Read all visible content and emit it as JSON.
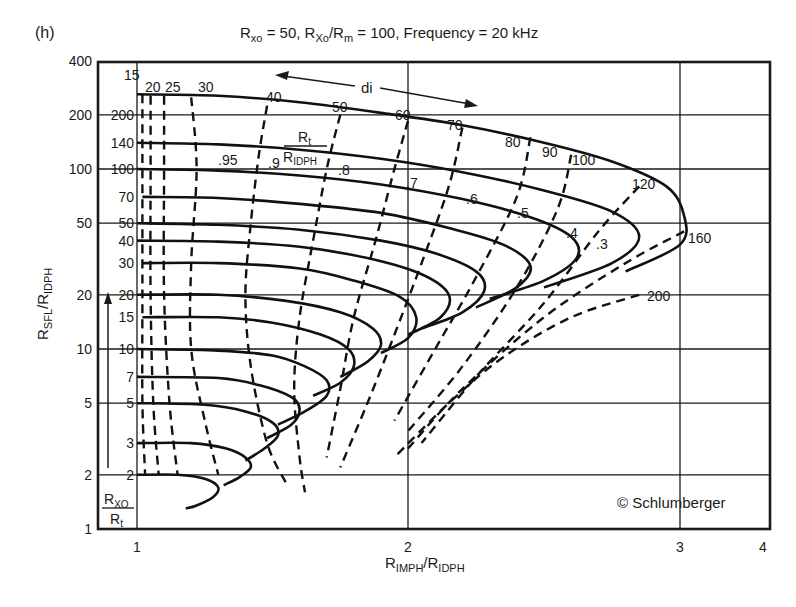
{
  "chart_data": {
    "type": "line",
    "panel_label": "(h)",
    "title": "Rxo = 50, Rxo/Rm = 100, Frequency = 20 kHz",
    "title_parts": {
      "r1": "R",
      "s1": "xo",
      "eq1": " = 50, ",
      "r2": "R",
      "s2": "Xo",
      "slash": "/R",
      "s3": "m",
      "eq2": " = 100, Frequency = 20 kHz"
    },
    "xlabel": "RIMPH/RIDPH",
    "xlabel_parts": {
      "r1": "R",
      "s1": "IMPH",
      "slash": "/R",
      "s2": "IDPH"
    },
    "ylabel": "RSFL/RIDPH",
    "ylabel_parts": {
      "r1": "R",
      "s1": "SFL",
      "slash": "/R",
      "s2": "IDPH"
    },
    "x_scale": "log-like (custom)",
    "y_scale": "log",
    "xlim": [
      1,
      4
    ],
    "ylim": [
      1,
      400
    ],
    "x_ticks": [
      "1",
      "2",
      "3",
      "4"
    ],
    "y_ticks": [
      "1",
      "2",
      "5",
      "10",
      "20",
      "50",
      "100",
      "200",
      "400"
    ],
    "grid": true,
    "rxo_rt_ticks": [
      "2",
      "3",
      "5",
      "7",
      "10",
      "15",
      "20",
      "30",
      "40",
      "50",
      "70",
      "100",
      "140",
      "200"
    ],
    "rxo_rt_label": {
      "num_r": "R",
      "num_s": "XO",
      "den_r": "R",
      "den_s": "t"
    },
    "rt_label": {
      "num_r": "R",
      "num_s": "t",
      "den_r": "R",
      "den_s": "IDPH"
    },
    "di_label": "di",
    "di_values": [
      "15",
      "20",
      "25",
      "30",
      "40",
      "50",
      "60",
      "70",
      "80",
      "90",
      "100",
      "120",
      "160",
      "200"
    ],
    "rt_ratio_values": [
      ".95",
      ".9",
      ".8",
      ".7",
      ".6",
      ".5",
      ".4",
      ".3"
    ],
    "copyright": "© Schlumberger",
    "series": [
      {
        "name": "Rxo/Rt = 200",
        "style": "solid",
        "points": [
          [
            1.0,
            260
          ],
          [
            1.3,
            255
          ],
          [
            1.6,
            235
          ],
          [
            1.9,
            205
          ],
          [
            2.2,
            175
          ],
          [
            2.5,
            140
          ],
          [
            2.75,
            110
          ],
          [
            2.95,
            80
          ],
          [
            3.05,
            55
          ],
          [
            3.0,
            38
          ],
          [
            2.8,
            27
          ]
        ]
      },
      {
        "name": "Rxo/Rt = 140",
        "style": "solid",
        "points": [
          [
            1.0,
            140
          ],
          [
            1.3,
            137
          ],
          [
            1.6,
            128
          ],
          [
            1.9,
            114
          ],
          [
            2.2,
            96
          ],
          [
            2.5,
            76
          ],
          [
            2.75,
            58
          ],
          [
            2.85,
            42
          ],
          [
            2.75,
            30
          ],
          [
            2.5,
            22
          ]
        ]
      },
      {
        "name": "Rxo/Rt = 100",
        "style": "solid",
        "points": [
          [
            1.0,
            100
          ],
          [
            1.3,
            98
          ],
          [
            1.6,
            92
          ],
          [
            1.9,
            82
          ],
          [
            2.2,
            68
          ],
          [
            2.45,
            54
          ],
          [
            2.6,
            42
          ],
          [
            2.62,
            32
          ],
          [
            2.5,
            24
          ],
          [
            2.3,
            19
          ]
        ]
      },
      {
        "name": "Rxo/Rt = 70",
        "style": "solid",
        "points": [
          [
            1.02,
            70
          ],
          [
            1.3,
            69
          ],
          [
            1.6,
            64
          ],
          [
            1.9,
            57
          ],
          [
            2.15,
            47
          ],
          [
            2.35,
            38
          ],
          [
            2.45,
            29
          ],
          [
            2.4,
            22
          ],
          [
            2.25,
            17
          ]
        ]
      },
      {
        "name": "Rxo/Rt = 50",
        "style": "solid",
        "points": [
          [
            1.0,
            50
          ],
          [
            1.3,
            49
          ],
          [
            1.6,
            46
          ],
          [
            1.9,
            40
          ],
          [
            2.1,
            34
          ],
          [
            2.25,
            27
          ],
          [
            2.28,
            21
          ],
          [
            2.2,
            16
          ],
          [
            2.05,
            13
          ]
        ]
      },
      {
        "name": "Rxo/Rt = 40",
        "style": "solid",
        "points": [
          [
            1.0,
            40
          ],
          [
            1.3,
            39.5
          ],
          [
            1.6,
            37
          ],
          [
            1.85,
            32
          ],
          [
            2.05,
            26
          ],
          [
            2.15,
            20
          ],
          [
            2.12,
            15
          ],
          [
            2.0,
            12
          ]
        ]
      },
      {
        "name": "Rxo/Rt = 30",
        "style": "solid",
        "points": [
          [
            1.02,
            30
          ],
          [
            1.3,
            30
          ],
          [
            1.6,
            28
          ],
          [
            1.8,
            24
          ],
          [
            1.97,
            19.5
          ],
          [
            2.03,
            15
          ],
          [
            2.0,
            11.5
          ],
          [
            1.9,
            9.5
          ]
        ]
      },
      {
        "name": "Rxo/Rt = 20",
        "style": "solid",
        "points": [
          [
            1.0,
            20
          ],
          [
            1.3,
            20
          ],
          [
            1.55,
            18.5
          ],
          [
            1.75,
            16
          ],
          [
            1.87,
            13
          ],
          [
            1.9,
            10.5
          ],
          [
            1.85,
            8.5
          ],
          [
            1.75,
            7
          ]
        ]
      },
      {
        "name": "Rxo/Rt = 15",
        "style": "solid",
        "points": [
          [
            1.02,
            15
          ],
          [
            1.3,
            15
          ],
          [
            1.5,
            14
          ],
          [
            1.68,
            12
          ],
          [
            1.78,
            10
          ],
          [
            1.8,
            8
          ],
          [
            1.75,
            6.5
          ],
          [
            1.65,
            5.5
          ]
        ]
      },
      {
        "name": "Rxo/Rt = 10",
        "style": "solid",
        "points": [
          [
            1.0,
            10
          ],
          [
            1.3,
            9.8
          ],
          [
            1.5,
            9.2
          ],
          [
            1.62,
            8
          ],
          [
            1.7,
            6.7
          ],
          [
            1.7,
            5.5
          ],
          [
            1.62,
            4.5
          ],
          [
            1.52,
            3.8
          ]
        ]
      },
      {
        "name": "Rxo/Rt = 7",
        "style": "solid",
        "points": [
          [
            1.0,
            7
          ],
          [
            1.3,
            6.9
          ],
          [
            1.45,
            6.3
          ],
          [
            1.57,
            5.4
          ],
          [
            1.6,
            4.6
          ],
          [
            1.57,
            3.8
          ],
          [
            1.48,
            3.2
          ]
        ]
      },
      {
        "name": "Rxo/Rt = 5",
        "style": "solid",
        "points": [
          [
            1.0,
            5
          ],
          [
            1.25,
            4.9
          ],
          [
            1.4,
            4.5
          ],
          [
            1.5,
            3.9
          ],
          [
            1.52,
            3.3
          ],
          [
            1.47,
            2.8
          ],
          [
            1.4,
            2.4
          ]
        ]
      },
      {
        "name": "Rxo/Rt = 3",
        "style": "solid",
        "points": [
          [
            1.0,
            3
          ],
          [
            1.2,
            3
          ],
          [
            1.33,
            2.8
          ],
          [
            1.4,
            2.5
          ],
          [
            1.42,
            2.2
          ],
          [
            1.38,
            1.95
          ],
          [
            1.32,
            1.75
          ]
        ]
      },
      {
        "name": "Rxo/Rt = 2",
        "style": "solid",
        "points": [
          [
            1.0,
            2
          ],
          [
            1.15,
            2
          ],
          [
            1.25,
            1.9
          ],
          [
            1.3,
            1.7
          ],
          [
            1.28,
            1.5
          ],
          [
            1.22,
            1.35
          ],
          [
            1.18,
            1.3
          ]
        ]
      },
      {
        "name": "di = 15",
        "style": "dashed",
        "points": [
          [
            1.02,
            260
          ],
          [
            1.02,
            100
          ],
          [
            1.02,
            20
          ],
          [
            1.02,
            5
          ],
          [
            1.03,
            2
          ]
        ]
      },
      {
        "name": "di = 20",
        "style": "dashed",
        "points": [
          [
            1.05,
            255
          ],
          [
            1.05,
            100
          ],
          [
            1.05,
            20
          ],
          [
            1.06,
            5
          ],
          [
            1.08,
            2
          ]
        ]
      },
      {
        "name": "di = 25",
        "style": "dashed",
        "points": [
          [
            1.1,
            255
          ],
          [
            1.1,
            100
          ],
          [
            1.1,
            20
          ],
          [
            1.12,
            5
          ],
          [
            1.15,
            2
          ]
        ]
      },
      {
        "name": "di = 30",
        "style": "dashed",
        "points": [
          [
            1.2,
            250
          ],
          [
            1.22,
            100
          ],
          [
            1.2,
            30
          ],
          [
            1.2,
            10
          ],
          [
            1.25,
            4
          ],
          [
            1.3,
            2
          ]
        ]
      },
      {
        "name": "di = 40",
        "style": "dashed",
        "points": [
          [
            1.48,
            225
          ],
          [
            1.45,
            120
          ],
          [
            1.42,
            50
          ],
          [
            1.4,
            20
          ],
          [
            1.42,
            8
          ],
          [
            1.48,
            3
          ],
          [
            1.55,
            1.8
          ]
        ]
      },
      {
        "name": "di = 50",
        "style": "dashed",
        "points": [
          [
            1.75,
            200
          ],
          [
            1.7,
            100
          ],
          [
            1.65,
            40
          ],
          [
            1.6,
            15
          ],
          [
            1.58,
            6
          ],
          [
            1.6,
            2.5
          ],
          [
            1.62,
            1.6
          ]
        ]
      },
      {
        "name": "di = 60",
        "style": "dashed",
        "points": [
          [
            2.0,
            185
          ],
          [
            1.95,
            100
          ],
          [
            1.88,
            40
          ],
          [
            1.8,
            15
          ],
          [
            1.75,
            6
          ],
          [
            1.7,
            2.5
          ]
        ]
      },
      {
        "name": "di = 70",
        "style": "dashed",
        "points": [
          [
            2.2,
            170
          ],
          [
            2.15,
            80
          ],
          [
            2.05,
            30
          ],
          [
            1.95,
            12
          ],
          [
            1.85,
            5
          ],
          [
            1.75,
            2.2
          ]
        ]
      },
      {
        "name": "di = 80",
        "style": "dashed",
        "points": [
          [
            2.45,
            150
          ],
          [
            2.4,
            70
          ],
          [
            2.25,
            25
          ],
          [
            2.1,
            10
          ],
          [
            1.95,
            4
          ]
        ]
      },
      {
        "name": "di = 100",
        "style": "dashed",
        "points": [
          [
            2.6,
            120
          ],
          [
            2.55,
            60
          ],
          [
            2.4,
            22
          ],
          [
            2.2,
            8
          ],
          [
            2.0,
            3.5
          ]
        ]
      },
      {
        "name": "di = 120",
        "style": "dashed",
        "points": [
          [
            2.85,
            80
          ],
          [
            2.7,
            45
          ],
          [
            2.5,
            18
          ],
          [
            2.25,
            7
          ],
          [
            2.05,
            3
          ]
        ]
      },
      {
        "name": "di = 160",
        "style": "dashed",
        "points": [
          [
            3.05,
            45
          ],
          [
            2.8,
            30
          ],
          [
            2.5,
            15
          ],
          [
            2.2,
            6
          ],
          [
            2.0,
            2.8
          ]
        ]
      },
      {
        "name": "di = 200",
        "style": "dashed",
        "points": [
          [
            2.85,
            20
          ],
          [
            2.6,
            15
          ],
          [
            2.35,
            9
          ],
          [
            2.15,
            5
          ],
          [
            1.95,
            2.5
          ]
        ]
      }
    ]
  }
}
